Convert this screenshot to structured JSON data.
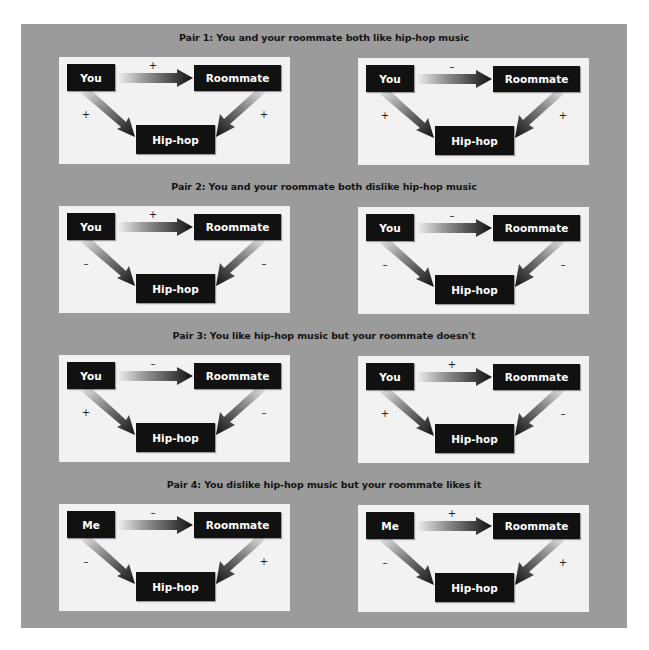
{
  "figure": {
    "colors": {
      "background": "#9b9b9b",
      "panel": "#f2f2f2",
      "node": "#111111",
      "node_text": "#ffffff"
    },
    "pairs": [
      {
        "title": "Pair 1: You and your roommate both like hip-hop music",
        "diagrams": [
          {
            "self": "You",
            "other": "Roommate",
            "object": "Hip-hop",
            "self_other": "+",
            "self_object": "+",
            "other_object": "+"
          },
          {
            "self": "You",
            "other": "Roommate",
            "object": "Hip-hop",
            "self_other": "–",
            "self_object": "+",
            "other_object": "+"
          }
        ]
      },
      {
        "title": "Pair 2: You and your roommate both dislike hip-hop  music",
        "diagrams": [
          {
            "self": "You",
            "other": "Roommate",
            "object": "Hip-hop",
            "self_other": "+",
            "self_object": "–",
            "other_object": "–"
          },
          {
            "self": "You",
            "other": "Roommate",
            "object": "Hip-hop",
            "self_other": "–",
            "self_object": "–",
            "other_object": "–"
          }
        ]
      },
      {
        "title": "Pair 3: You like hip-hop music but your roommate doesn't",
        "diagrams": [
          {
            "self": "You",
            "other": "Roommate",
            "object": "Hip-hop",
            "self_other": "–",
            "self_object": "+",
            "other_object": "–"
          },
          {
            "self": "You",
            "other": "Roommate",
            "object": "Hip-hop",
            "self_other": "+",
            "self_object": "+",
            "other_object": "–"
          }
        ]
      },
      {
        "title": "Pair 4: You dislike hip-hop music but your roommate likes it",
        "diagrams": [
          {
            "self": "Me",
            "other": "Roommate",
            "object": "Hip-hop",
            "self_other": "–",
            "self_object": "–",
            "other_object": "+"
          },
          {
            "self": "Me",
            "other": "Roommate",
            "object": "Hip-hop",
            "self_other": "+",
            "self_object": "–",
            "other_object": "+"
          }
        ]
      }
    ]
  }
}
